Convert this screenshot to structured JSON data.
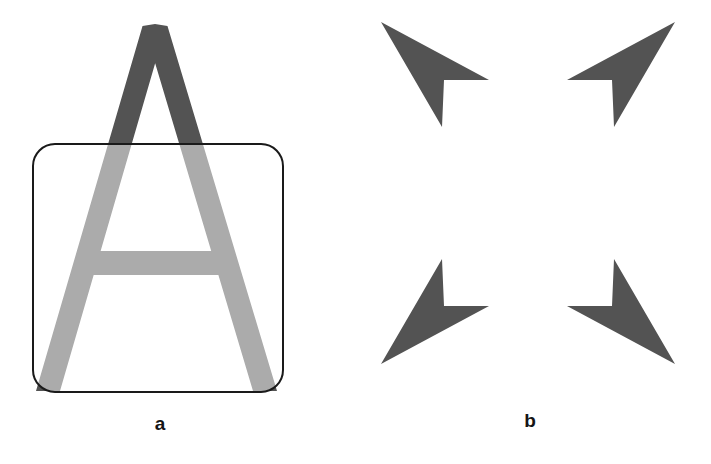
{
  "figure": {
    "background_color": "#ffffff",
    "width": 711,
    "height": 464
  },
  "colors": {
    "dark_gray": "#535353",
    "light_gray": "#ababab",
    "outline_black": "#1a1a1a",
    "background": "#ffffff",
    "label_text": "#151515"
  },
  "panels": [
    {
      "id": "a",
      "label": "a",
      "description": "Capital letter A partly occluded by a rounded rectangle; the portion of the A inside the rectangle is light gray, the portion above it is dark gray",
      "elements": {
        "letter": {
          "name": "letter-a-glyph",
          "character": "A",
          "upper_color": "#535353",
          "lower_color": "#ababab",
          "apex_x": 155,
          "apex_y": 24,
          "baseline_y": 391,
          "crossbar_top_y": 251,
          "crossbar_bottom_y": 275,
          "left_foot_x": 36,
          "right_foot_x": 277,
          "stroke_width": 24
        },
        "occluder": {
          "name": "rounded-rectangle-occluder",
          "x": 33,
          "y": 144,
          "width": 250,
          "height": 248,
          "corner_radius": 22,
          "stroke_color": "#1a1a1a",
          "stroke_width": 2,
          "fill": "none"
        }
      }
    },
    {
      "id": "b",
      "label": "b",
      "description": "Four notched arrowhead shapes arranged at the corners of an invisible square, inducing an illusory square / cross percept",
      "elements": {
        "arrows": [
          {
            "name": "arrow-top-left",
            "fill": "#535353",
            "points": "26,22 134,80 89,80 87,127 "
          },
          {
            "name": "arrow-top-right",
            "fill": "#535353",
            "points": "320,22 212,80 257,80 259,127"
          },
          {
            "name": "arrow-bottom-left",
            "fill": "#535353",
            "points": "26,364 134,306 89,306 87,259"
          },
          {
            "name": "arrow-bottom-right",
            "fill": "#535353",
            "points": "320,364 212,306 257,306 259,259"
          }
        ]
      }
    }
  ]
}
